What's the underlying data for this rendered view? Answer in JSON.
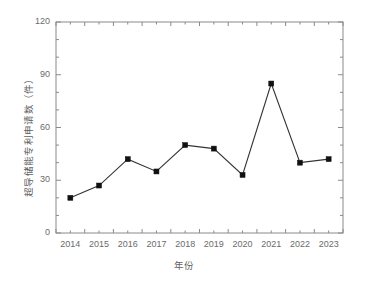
{
  "chart_data": {
    "type": "line",
    "title": "",
    "xlabel": "年份",
    "ylabel": "超导储能专利申请数（件）",
    "categories": [
      "2014",
      "2015",
      "2016",
      "2017",
      "2018",
      "2019",
      "2020",
      "2021",
      "2022",
      "2023"
    ],
    "values": [
      20,
      27,
      42,
      35,
      50,
      48,
      33,
      85,
      40,
      42
    ],
    "series": [
      {
        "name": "超导储能专利申请数",
        "values": [
          20,
          27,
          42,
          35,
          50,
          48,
          33,
          85,
          40,
          42
        ]
      }
    ],
    "ylim": [
      0,
      120
    ],
    "ytick_labels": [
      "0",
      "30",
      "60",
      "90",
      "120"
    ],
    "ytick_values": [
      0,
      30,
      60,
      90,
      120
    ],
    "yminor_step": 10,
    "xtick_labels": [
      "2014",
      "2015",
      "2016",
      "2017",
      "2018",
      "2019",
      "2020",
      "2021",
      "2022",
      "2023"
    ],
    "grid": false,
    "legend": "none",
    "marker": "square",
    "marker_color": "#111111",
    "line_color": "#333333",
    "axis_color": "#8a8a8a",
    "text_color": "#6b6b6b",
    "background": "#ffffff"
  }
}
